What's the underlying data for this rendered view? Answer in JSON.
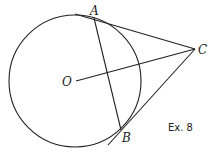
{
  "diagram": {
    "labels": {
      "A": "A",
      "B": "B",
      "C": "C",
      "O": "O"
    },
    "caption": "Ex. 8",
    "stroke_color": "#222222",
    "background": "#ffffff",
    "elements": {
      "circle": {
        "center": "O",
        "cx": 75,
        "cy": 81,
        "r": 66
      },
      "tangent_A": {
        "from": "A",
        "to": "C"
      },
      "tangent_B": {
        "from": "B",
        "to": "C"
      },
      "chord_AB": {
        "from": "A",
        "to": "B"
      },
      "segment_OC": {
        "from": "O",
        "to": "C"
      }
    }
  }
}
